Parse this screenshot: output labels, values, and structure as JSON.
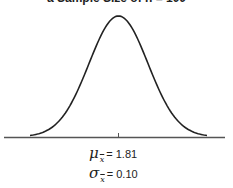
{
  "chart_data": {
    "type": "line",
    "title": "a Sample Size of n = 100",
    "distribution": "normal",
    "mean": 1.81,
    "std_error": 0.1,
    "x_range_sigma": [
      -3,
      3
    ],
    "xlabel": "",
    "ylabel": "",
    "x_ticks": [
      1.81
    ],
    "grid": false,
    "legend": null,
    "annotations": [
      {
        "symbol": "μ",
        "subscript": "x̄",
        "text": "= 1.81"
      },
      {
        "symbol": "σ",
        "subscript": "x̄",
        "text": "= 0.10"
      }
    ]
  },
  "stats": {
    "mean": {
      "symbol": "μ",
      "subscript": "x",
      "value": "= 1.81"
    },
    "sd": {
      "symbol": "σ",
      "subscript": "x",
      "value": "= 0.10"
    }
  },
  "colors": {
    "curve": "#222222",
    "axis": "#555555",
    "background": "#ffffff"
  }
}
